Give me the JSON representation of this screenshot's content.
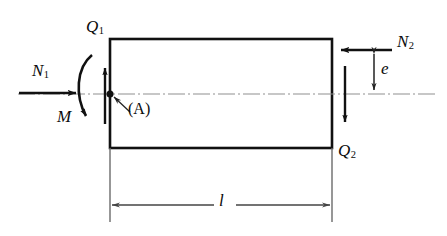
{
  "figure": {
    "type": "engineering-free-body-diagram",
    "colors": {
      "outline": "#111111",
      "arrow": "#111111",
      "centerline": "#8a8a8a",
      "dimension": "#555555",
      "background": "#ffffff"
    }
  },
  "labels": {
    "q1": {
      "base": "Q",
      "sub": "1"
    },
    "q2": {
      "base": "Q",
      "sub": "2"
    },
    "n1": {
      "base": "N",
      "sub": "1"
    },
    "n2": {
      "base": "N",
      "sub": "2"
    },
    "moment": "M",
    "eccentricity": "e",
    "length": "l",
    "point_a": "(A)"
  },
  "geometry": {
    "rect": {
      "x": 110,
      "y": 39,
      "width": 222,
      "height": 109
    },
    "centerline_y": 94,
    "dimension_line_y": 205,
    "eccentricity_top_y": 50,
    "eccentricity_bottom_y": 94,
    "point_a": {
      "x": 110,
      "y": 94
    }
  }
}
